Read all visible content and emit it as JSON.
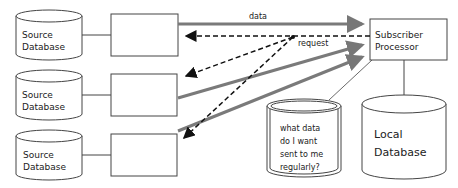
{
  "diagram": {
    "source_databases": [
      {
        "label_line1": "Source",
        "label_line2": "Database"
      },
      {
        "label_line1": "Source",
        "label_line2": "Database"
      },
      {
        "label_line1": "Source",
        "label_line2": "Database"
      }
    ],
    "subscriber": {
      "label_line1": "Subscriber",
      "label_line2": "Processor"
    },
    "local_database": {
      "label_line1": "Local",
      "label_line2": "Database"
    },
    "question_store": {
      "line1": "what data",
      "line2": "do I want",
      "line3": "sent to me",
      "line4": "regularly?"
    },
    "edges": {
      "data_label": "data",
      "request_label": "request"
    },
    "colors": {
      "stroke": "#333333",
      "data_arrow": "#7a7a7a",
      "request_arrow": "#111111"
    }
  }
}
